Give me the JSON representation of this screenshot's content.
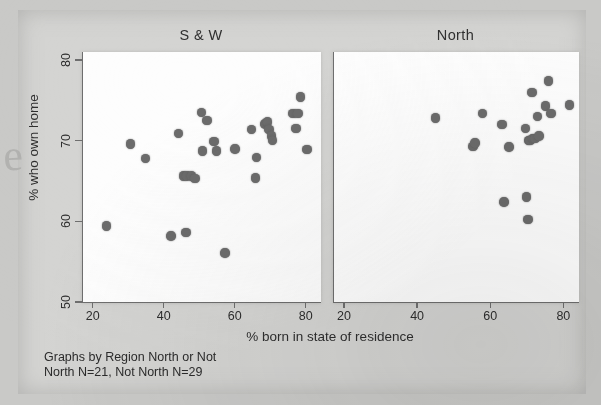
{
  "figure": {
    "background_color": "#c9c9c7",
    "plate_color": "#d4d4d2",
    "marker_color": "#6b6b6b",
    "axis_color": "#6e6e6e",
    "panel_color": "#fdfdfd",
    "edge_artifact_glyph": "e"
  },
  "axis": {
    "xlabel": "% born in state of residence",
    "ylabel": "% who own home",
    "xticks": [
      20,
      40,
      60,
      80
    ],
    "yticks": [
      50,
      60,
      70,
      80
    ],
    "xlim": [
      17,
      84
    ],
    "ylim": [
      50,
      81
    ]
  },
  "caption": {
    "line1": "Graphs by Region North or Not",
    "line2": "North N=21, Not North N=29",
    "text": "Graphs by Region North or Not\nNorth N=21, Not North N=29"
  },
  "chart_data": {
    "type": "scatter",
    "title": "",
    "xlabel": "% born in state of residence",
    "ylabel": "% who own home",
    "xlim": [
      17,
      84
    ],
    "ylim": [
      50,
      81
    ],
    "xticks": [
      20,
      40,
      60,
      80
    ],
    "yticks": [
      50,
      60,
      70,
      80
    ],
    "grid": false,
    "legend": "none",
    "facet_layout": "1x2",
    "panels": [
      {
        "label": "S & W",
        "n": 29,
        "points": [
          [
            23.6,
            59.4
          ],
          [
            30.4,
            69.6
          ],
          [
            34.6,
            67.8
          ],
          [
            41.8,
            58.2
          ],
          [
            43.9,
            70.9
          ],
          [
            45.3,
            65.6
          ],
          [
            46.3,
            65.6
          ],
          [
            46.0,
            58.6
          ],
          [
            47.6,
            65.6
          ],
          [
            48.5,
            65.3
          ],
          [
            50.4,
            73.5
          ],
          [
            50.7,
            68.7
          ],
          [
            51.9,
            72.5
          ],
          [
            53.9,
            69.9
          ],
          [
            54.6,
            68.7
          ],
          [
            57.0,
            56.1
          ],
          [
            59.8,
            69.0
          ],
          [
            64.4,
            71.4
          ],
          [
            65.8,
            67.9
          ],
          [
            65.5,
            65.4
          ],
          [
            68.2,
            72.1
          ],
          [
            68.9,
            72.3
          ],
          [
            69.4,
            71.4
          ],
          [
            70.1,
            70.6
          ],
          [
            70.4,
            70.0
          ],
          [
            76.1,
            73.4
          ],
          [
            76.9,
            71.5
          ],
          [
            77.5,
            73.4
          ],
          [
            78.2,
            75.4
          ],
          [
            80.1,
            68.9
          ]
        ]
      },
      {
        "label": "North",
        "n": 21,
        "points": [
          [
            44.8,
            72.8
          ],
          [
            55.0,
            69.3
          ],
          [
            55.6,
            69.7
          ],
          [
            57.6,
            73.4
          ],
          [
            63.0,
            72.0
          ],
          [
            63.5,
            62.4
          ],
          [
            64.9,
            69.2
          ],
          [
            69.6,
            63.0
          ],
          [
            69.4,
            71.5
          ],
          [
            70.0,
            60.2
          ],
          [
            70.2,
            70.0
          ],
          [
            70.6,
            70.0
          ],
          [
            71.2,
            76.0
          ],
          [
            71.3,
            70.3
          ],
          [
            72.0,
            70.3
          ],
          [
            72.6,
            73.0
          ],
          [
            73.1,
            70.6
          ],
          [
            74.9,
            74.3
          ],
          [
            75.6,
            77.4
          ],
          [
            76.3,
            73.4
          ],
          [
            81.4,
            74.4
          ]
        ]
      }
    ]
  }
}
